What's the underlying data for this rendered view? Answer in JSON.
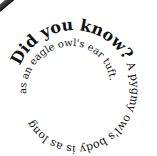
{
  "fact": {
    "headline": "Did you know?",
    "body_outer": " A pygmy owl's body is as long",
    "body_inner": " as an eagle owl's ear tuft."
  },
  "colors": {
    "text": "#111111",
    "background": "#ffffff",
    "corner_stripe": "#222222"
  }
}
